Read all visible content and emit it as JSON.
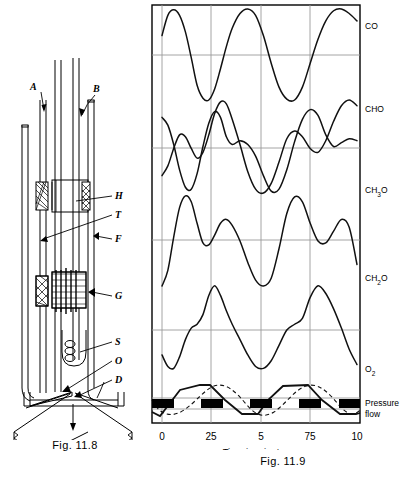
{
  "figure_left": {
    "caption": "Fig. 11.8",
    "callouts": [
      {
        "id": "A",
        "label": "A",
        "x": 33,
        "y": 86
      },
      {
        "id": "B",
        "label": "B",
        "x": 96,
        "y": 88
      },
      {
        "id": "H",
        "label": "H",
        "x": 116,
        "y": 196
      },
      {
        "id": "T",
        "label": "T",
        "x": 117,
        "y": 214
      },
      {
        "id": "F",
        "label": "F",
        "x": 118,
        "y": 238
      },
      {
        "id": "G",
        "label": "G",
        "x": 117,
        "y": 295
      },
      {
        "id": "S",
        "label": "S",
        "x": 117,
        "y": 341
      },
      {
        "id": "O",
        "label": "O",
        "x": 117,
        "y": 360
      },
      {
        "id": "D",
        "label": "D",
        "x": 117,
        "y": 379
      }
    ]
  },
  "chart_data": {
    "type": "line",
    "title": "Fig. 11.9",
    "xlabel": "Time in minutes",
    "ylabel": "",
    "grid": true,
    "legend_position": "right-of-axis",
    "xticks": [
      "0",
      "25",
      "5",
      "75",
      "10"
    ],
    "xtick_positions": [
      0,
      0.25,
      0.5,
      0.75,
      1.0
    ],
    "xlim": [
      0,
      1
    ],
    "series": [
      {
        "name": "CO",
        "panel": 0,
        "style": "solid",
        "description": "smooth oscillation, rounded maxima, sharp minima, about 2.4 cycles",
        "x": [
          0.0,
          0.03,
          0.06,
          0.09,
          0.12,
          0.15,
          0.18,
          0.21,
          0.24,
          0.27,
          0.3,
          0.33,
          0.36,
          0.4,
          0.44,
          0.48,
          0.52,
          0.56,
          0.6,
          0.64,
          0.68,
          0.72,
          0.76,
          0.8,
          0.84,
          0.88,
          0.92,
          0.96,
          1.0
        ],
        "y": [
          0.7,
          0.92,
          0.98,
          0.92,
          0.74,
          0.46,
          0.16,
          0.02,
          0.0,
          0.12,
          0.34,
          0.58,
          0.78,
          0.94,
          0.99,
          0.92,
          0.7,
          0.4,
          0.14,
          0.01,
          0.0,
          0.14,
          0.4,
          0.66,
          0.86,
          0.97,
          0.99,
          0.94,
          0.86
        ]
      },
      {
        "name": "CHO",
        "panel": 1,
        "style": "solid",
        "description": "double-humped wave with central dip each cycle",
        "x": [
          0.0,
          0.03,
          0.06,
          0.09,
          0.12,
          0.15,
          0.18,
          0.21,
          0.24,
          0.27,
          0.3,
          0.33,
          0.36,
          0.4,
          0.44,
          0.48,
          0.52,
          0.56,
          0.6,
          0.64,
          0.68,
          0.72,
          0.76,
          0.8,
          0.84,
          0.88,
          0.92,
          0.96,
          1.0
        ],
        "y": [
          0.8,
          0.72,
          0.52,
          0.26,
          0.08,
          0.06,
          0.22,
          0.5,
          0.74,
          0.86,
          0.8,
          0.6,
          0.52,
          0.56,
          0.52,
          0.4,
          0.2,
          0.04,
          0.06,
          0.26,
          0.55,
          0.78,
          0.88,
          0.82,
          0.62,
          0.5,
          0.54,
          0.58,
          0.56
        ]
      },
      {
        "name": "CH3O",
        "panel": 1,
        "style": "solid",
        "description": "wave in antiphase with CHO, crossing it near gridlines",
        "x": [
          0.0,
          0.03,
          0.06,
          0.09,
          0.12,
          0.15,
          0.18,
          0.21,
          0.24,
          0.27,
          0.3,
          0.33,
          0.36,
          0.4,
          0.44,
          0.48,
          0.52,
          0.56,
          0.6,
          0.64,
          0.68,
          0.72,
          0.76,
          0.8,
          0.84,
          0.88,
          0.92,
          0.96,
          1.0
        ],
        "y": [
          0.2,
          0.3,
          0.48,
          0.62,
          0.6,
          0.48,
          0.38,
          0.44,
          0.62,
          0.84,
          0.96,
          0.94,
          0.78,
          0.52,
          0.24,
          0.06,
          0.02,
          0.12,
          0.34,
          0.58,
          0.66,
          0.6,
          0.48,
          0.44,
          0.56,
          0.76,
          0.92,
          0.98,
          0.92
        ]
      },
      {
        "name": "CH2O",
        "panel": 2,
        "style": "solid",
        "description": "large peak followed by smaller secondary peak each cycle",
        "x": [
          0.0,
          0.03,
          0.06,
          0.09,
          0.12,
          0.15,
          0.18,
          0.21,
          0.24,
          0.27,
          0.3,
          0.33,
          0.36,
          0.4,
          0.44,
          0.48,
          0.52,
          0.56,
          0.6,
          0.64,
          0.68,
          0.72,
          0.76,
          0.8,
          0.84,
          0.88,
          0.92,
          0.96,
          1.0
        ],
        "y": [
          0.02,
          0.18,
          0.52,
          0.82,
          0.94,
          0.88,
          0.66,
          0.46,
          0.44,
          0.54,
          0.66,
          0.7,
          0.64,
          0.48,
          0.26,
          0.08,
          0.02,
          0.1,
          0.4,
          0.76,
          0.93,
          0.88,
          0.66,
          0.48,
          0.46,
          0.58,
          0.7,
          0.62,
          0.24
        ]
      },
      {
        "name": "O2",
        "panel": 3,
        "style": "solid",
        "description": "slow rise with shoulder then sharp peak and decline",
        "x": [
          0.0,
          0.03,
          0.06,
          0.09,
          0.12,
          0.15,
          0.18,
          0.21,
          0.24,
          0.27,
          0.3,
          0.33,
          0.36,
          0.4,
          0.44,
          0.48,
          0.52,
          0.56,
          0.6,
          0.64,
          0.68,
          0.72,
          0.76,
          0.8,
          0.84,
          0.88,
          0.92,
          0.96,
          1.0
        ],
        "y": [
          0.24,
          0.12,
          0.1,
          0.22,
          0.4,
          0.52,
          0.56,
          0.66,
          0.86,
          0.96,
          0.86,
          0.7,
          0.56,
          0.4,
          0.24,
          0.12,
          0.1,
          0.18,
          0.34,
          0.5,
          0.56,
          0.62,
          0.84,
          0.96,
          0.88,
          0.72,
          0.52,
          0.3,
          0.14
        ]
      },
      {
        "name": "Pressure",
        "panel": 4,
        "style": "solid-triangular",
        "description": "triangular / trapezoidal wave with flat segments"
      },
      {
        "name": "flow",
        "panel": 4,
        "style": "dashed-sine",
        "description": "dashed sinusoid lagging the pressure wave"
      }
    ],
    "panel_labels": [
      "CO",
      "CHO",
      "CH3O",
      "CH2O",
      "O2"
    ],
    "right_labels": [
      {
        "text_main": "CO",
        "sub": "",
        "x": 366,
        "y": 27
      },
      {
        "text_main": "CHO",
        "sub": "",
        "x": 366,
        "y": 110
      },
      {
        "text_main": "CH",
        "sub": "3",
        "tail": "O",
        "x": 366,
        "y": 190
      },
      {
        "text_main": "CH",
        "sub": "2",
        "tail": "O",
        "x": 366,
        "y": 277
      },
      {
        "text_main": "O",
        "sub": "2",
        "tail": "",
        "x": 366,
        "y": 367
      },
      {
        "text_main": "Pressure",
        "sub": "",
        "x": 366,
        "y": 404
      },
      {
        "text_main": "flow",
        "sub": "",
        "x": 366,
        "y": 415
      }
    ]
  },
  "figure_right": {
    "caption": "Fig. 11.9",
    "axis_title": "Time in minutes"
  }
}
